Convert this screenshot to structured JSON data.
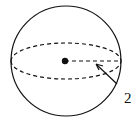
{
  "diagram": {
    "type": "sphere",
    "radius_label": "2",
    "colors": {
      "stroke": "#111111",
      "background": "#ffffff"
    },
    "geometry": {
      "center": [
        65,
        61
      ],
      "radius": 55,
      "equator_ry": 18
    }
  }
}
